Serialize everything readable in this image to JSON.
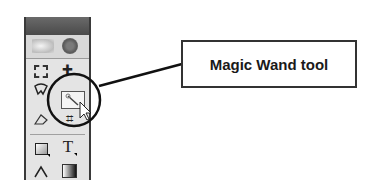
{
  "callout": {
    "label": "Magic Wand tool"
  },
  "toolbox": {
    "tools": [
      {
        "name": "rectangular-marquee",
        "row": 1,
        "col": 1
      },
      {
        "name": "move",
        "row": 1,
        "col": 2,
        "glyph": "✚"
      },
      {
        "name": "lasso",
        "row": 2,
        "col": 1
      },
      {
        "name": "magic-wand",
        "row": 2,
        "col": 2,
        "highlighted": true
      },
      {
        "name": "crop",
        "row": 3,
        "col": 2,
        "glyph": "⌗"
      },
      {
        "name": "slice",
        "row": 3,
        "col": 1
      },
      {
        "name": "rectangle-shape",
        "row": 4,
        "col": 1,
        "glyph": "□"
      },
      {
        "name": "type",
        "row": 4,
        "col": 2,
        "glyph": "T"
      },
      {
        "name": "pen",
        "row": 5,
        "col": 1,
        "glyph": "∆"
      },
      {
        "name": "gradient",
        "row": 5,
        "col": 2,
        "glyph": "▣"
      }
    ]
  },
  "colors": {
    "panel_bg": "#e4e4e4",
    "panel_header": "#555555",
    "outline": "#1a1a1a"
  }
}
